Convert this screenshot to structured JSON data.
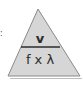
{
  "diagram": {
    "type": "formula-triangle",
    "numerator": "v",
    "denominator": "f x λ",
    "colors": {
      "fill": "#d6d6d6",
      "stroke": "#8a8a8a",
      "text": "#2b2b2b",
      "shadow": "#bdbdbd"
    }
  },
  "edge_fragment": ":"
}
